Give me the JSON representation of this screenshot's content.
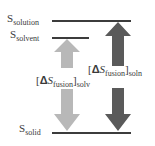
{
  "levels": {
    "solution": {
      "symbol": "S",
      "subscript": "solution"
    },
    "solvent": {
      "symbol": "S",
      "subscript": "solvent"
    },
    "solid": {
      "symbol": "S",
      "subscript": "solid"
    }
  },
  "transitions": {
    "solv": {
      "delta": "Δ",
      "symbol": "S",
      "subscript": "fusion",
      "outer_subscript": "solv",
      "color": "#b8b8b8"
    },
    "soln": {
      "delta": "Δ",
      "symbol": "S",
      "subscript": "fusion",
      "outer_subscript": "soln",
      "color": "#5a5a5a"
    }
  },
  "colors": {
    "level_line": "#3c3c3c",
    "light_arrow": "#b8b8b8",
    "dark_arrow": "#5a5a5a"
  }
}
